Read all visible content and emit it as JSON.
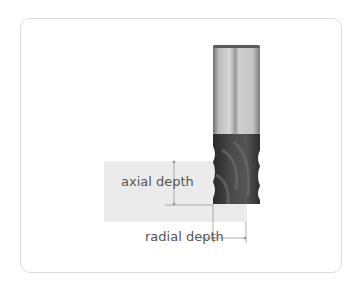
{
  "diagram": {
    "labels": {
      "axial": "axial depth",
      "radial": "radial depth"
    },
    "colors": {
      "workpiece": "#ebebeb",
      "shank_light": "#d4d4d4",
      "shank_dark": "#8a8a8a",
      "flute_dark": "#3a3a3a",
      "dimension_line": "#9a9a9a",
      "label_text": "#555555",
      "card_border": "#dcdcdc"
    }
  }
}
